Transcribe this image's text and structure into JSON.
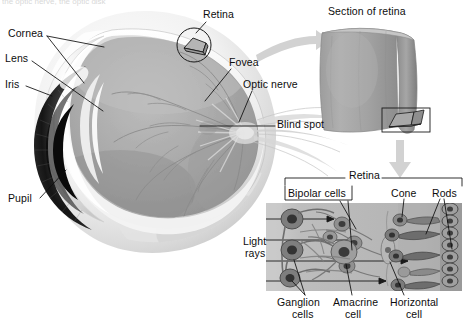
{
  "figure": {
    "title_cutoff": "the optic nerve, the optic disk",
    "background": "#ffffff",
    "ink": "#0d0d0d",
    "arrow_color": "#d2d2d2"
  },
  "eye": {
    "labels": [
      {
        "id": "cornea",
        "text": "Cornea",
        "x": 8,
        "y": 28,
        "leaders": 2
      },
      {
        "id": "lens",
        "text": "Lens",
        "x": 5,
        "y": 58,
        "leaders": 1
      },
      {
        "id": "iris",
        "text": "Iris",
        "x": 5,
        "y": 83,
        "leaders": 1
      },
      {
        "id": "pupil",
        "text": "Pupil",
        "x": 8,
        "y": 196,
        "leaders": 1
      },
      {
        "id": "retina",
        "text": "Retina",
        "x": 203,
        "y": 9,
        "leaders": 1
      },
      {
        "id": "fovea",
        "text": "Fovea",
        "x": 229,
        "y": 57,
        "leaders": 1
      },
      {
        "id": "optic-nerve",
        "text": "Optic nerve",
        "x": 243,
        "y": 79,
        "leaders": 1
      },
      {
        "id": "blind-spot",
        "text": "Blind spot",
        "x": 277,
        "y": 121,
        "leaders": 1
      }
    ],
    "colors": {
      "sclera_light": "#fbfbfb",
      "sclera_shadow": "#d6d6d6",
      "interior": "#a9a9a9",
      "interior_dark": "#949494",
      "iris_dark": "#1d1d1d",
      "vessel": "#8a8a8a"
    }
  },
  "section_panel": {
    "title": "Section of retina",
    "title_x": 328,
    "title_y": 8,
    "slab_color": "#a2a2a2",
    "slab_edge": "#8b8b8b",
    "callout_box": true
  },
  "arrows": [
    {
      "id": "arrow-to-section",
      "direction": "right",
      "curved": true
    },
    {
      "id": "arrow-to-cells",
      "direction": "down",
      "curved": false
    }
  ],
  "cell_panel": {
    "bracket_label": "Retina",
    "labels_top": [
      {
        "id": "bipolar-cells",
        "text": "Bipolar cells",
        "x": 287,
        "y": 190
      },
      {
        "id": "cone",
        "text": "Cone",
        "x": 392,
        "y": 189
      },
      {
        "id": "rods",
        "text": "Rods",
        "x": 433,
        "y": 189
      }
    ],
    "labels_side": [
      {
        "id": "light-rays",
        "line1": "Light",
        "line2": "rays",
        "x": 245,
        "y": 243
      }
    ],
    "labels_bottom": [
      {
        "id": "ganglion-cells",
        "line1": "Ganglion",
        "line2": "cells",
        "x": 282,
        "y": 300
      },
      {
        "id": "amacrine-cell",
        "line1": "Amacrine",
        "line2": "cell",
        "x": 340,
        "y": 300
      },
      {
        "id": "horizontal-cell",
        "line1": "Horizontal",
        "line2": "cell",
        "x": 400,
        "y": 300
      }
    ],
    "colors": {
      "field": "#b6b6b6",
      "field_light": "#c9c9c9",
      "cell_body": "#8e8e8e",
      "cell_dark": "#5c5c5c",
      "nucleus": "#3a3a3a",
      "pigment": "#6f6f6f"
    },
    "light_ray_count": 4
  }
}
